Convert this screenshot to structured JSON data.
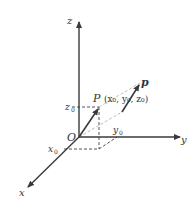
{
  "diagram": {
    "type": "3d-coordinate-vector",
    "axes": {
      "x": {
        "label": "x"
      },
      "y": {
        "label": "y"
      },
      "z": {
        "label": "z"
      }
    },
    "origin": {
      "label": "O"
    },
    "point": {
      "label": "P",
      "coords_text": "(x₀, y₀, z₀)",
      "x0": "x",
      "y0": "y",
      "z0": "z",
      "subscript": "0"
    },
    "vector": {
      "label": "p"
    },
    "projections": {
      "x_label": "x",
      "y_label": "y",
      "z_label": "z",
      "subscript": "0"
    },
    "colors": {
      "axis": "#3a3a3a",
      "dashed": "#555555",
      "light_dashed": "#b8b8b8",
      "text": "#333333"
    }
  }
}
